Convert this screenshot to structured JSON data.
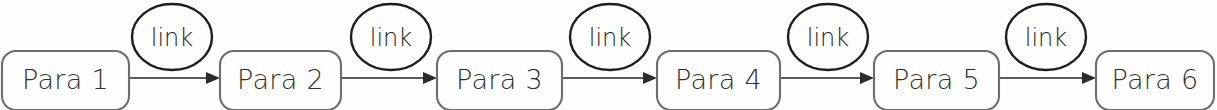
{
  "diagram": {
    "type": "flowchart",
    "orientation": "left-to-right",
    "background_color": "#fdfdfc",
    "node_stroke_color": "#6d6d6d",
    "node_fill_color": "#fefefe",
    "edge_color": "#5b5b5b",
    "ellipse_stroke_color": "#1d1d1d",
    "text_color": "#2f2f2f",
    "nodes": [
      {
        "id": "para-1",
        "label": "Para 1",
        "shape": "rounded-rect",
        "x": 2,
        "y": 51,
        "w": 127,
        "h": 59
      },
      {
        "id": "para-2",
        "label": "Para 2",
        "shape": "rounded-rect",
        "x": 220,
        "y": 51,
        "w": 121,
        "h": 59
      },
      {
        "id": "para-3",
        "label": "Para 3",
        "shape": "rounded-rect",
        "x": 437,
        "y": 51,
        "w": 125,
        "h": 59
      },
      {
        "id": "para-4",
        "label": "Para 4",
        "shape": "rounded-rect",
        "x": 657,
        "y": 51,
        "w": 123,
        "h": 59
      },
      {
        "id": "para-5",
        "label": "Para 5",
        "shape": "rounded-rect",
        "x": 874,
        "y": 51,
        "w": 125,
        "h": 59
      },
      {
        "id": "para-6",
        "label": "Para 6",
        "shape": "rounded-rect",
        "x": 1096,
        "y": 51,
        "w": 118,
        "h": 59
      }
    ],
    "edges": [
      {
        "id": "edge-1",
        "from": "para-1",
        "to": "para-2",
        "label": "link",
        "arrow": true,
        "y": 78,
        "x1": 129,
        "x2": 220,
        "ellipse_cx": 172,
        "ellipse_cy": 37
      },
      {
        "id": "edge-2",
        "from": "para-2",
        "to": "para-3",
        "label": "link",
        "arrow": true,
        "y": 78,
        "x1": 341,
        "x2": 437,
        "ellipse_cx": 391,
        "ellipse_cy": 37
      },
      {
        "id": "edge-3",
        "from": "para-3",
        "to": "para-4",
        "label": "link",
        "arrow": true,
        "y": 78,
        "x1": 562,
        "x2": 657,
        "ellipse_cx": 610,
        "ellipse_cy": 37
      },
      {
        "id": "edge-4",
        "from": "para-4",
        "to": "para-5",
        "label": "link",
        "arrow": true,
        "y": 78,
        "x1": 780,
        "x2": 874,
        "ellipse_cx": 828,
        "ellipse_cy": 37
      },
      {
        "id": "edge-5",
        "from": "para-5",
        "to": "para-6",
        "label": "link",
        "arrow": true,
        "y": 78,
        "x1": 999,
        "x2": 1096,
        "ellipse_cx": 1046,
        "ellipse_cy": 37
      }
    ],
    "ellipse_rx": 40,
    "ellipse_ry": 33
  }
}
